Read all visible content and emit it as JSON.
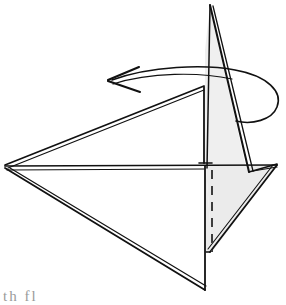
{
  "figure": {
    "background_color": "#ffffff",
    "stroke_color": "#1a1a1a",
    "shade_color": "#efefef",
    "shade_color_dark": "#e7e7e7",
    "dashed_line_color": "#555555",
    "caption_fragment": "th fl",
    "caption_color": "#9a9a9a",
    "canvas": {
      "width": 286,
      "height": 298
    },
    "annotations": {
      "arrow_direction": "counterclockwise-left",
      "arrow_head_position": "left",
      "hidden_edge_style": "dashed"
    },
    "vertices": {
      "left_apex": [
        5,
        167
      ],
      "spike_tip": [
        210,
        5
      ],
      "upper_wing_corner": [
        204,
        87
      ],
      "center_junction": [
        205,
        163
      ],
      "right_vertex": [
        277,
        165
      ],
      "bottom_apex": [
        205,
        290
      ],
      "right_lower_tip": [
        212,
        252
      ],
      "spike_base_right": [
        246,
        168
      ]
    }
  }
}
